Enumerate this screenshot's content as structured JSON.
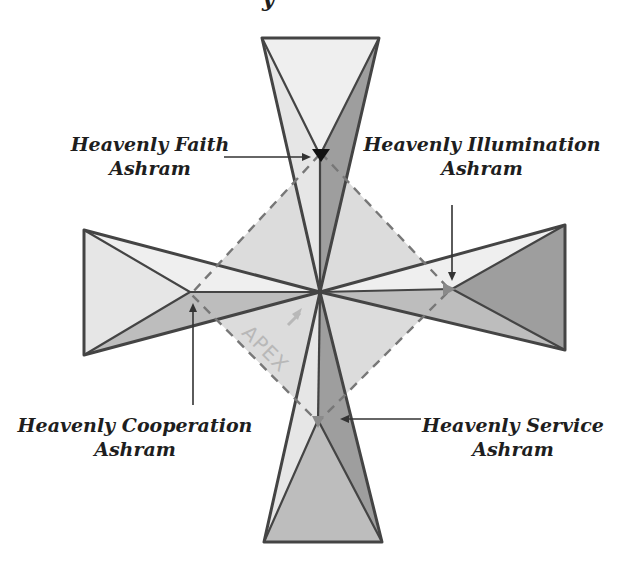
{
  "title_fragment": "y",
  "labels": {
    "faith": {
      "line1": "Heavenly Faith",
      "line2": "Ashram"
    },
    "illumination": {
      "line1": "Heavenly Illumination",
      "line2": "Ashram"
    },
    "cooperation": {
      "line1": "Heavenly Cooperation",
      "line2": "Ashram"
    },
    "service": {
      "line1": "Heavenly Service",
      "line2": "Ashram"
    }
  },
  "apex_label": "APEX",
  "colors": {
    "light": "#e6e6e6",
    "lighter": "#efefef",
    "medium": "#bdbdbd",
    "dark": "#9e9e9e",
    "diamond": "#dcdcdc",
    "marker": "#111111",
    "marker_grey": "#8a8a8a"
  }
}
